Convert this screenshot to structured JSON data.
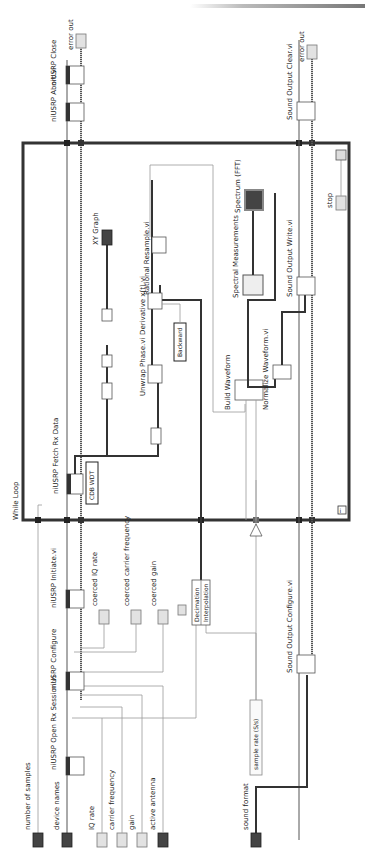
{
  "diagram": {
    "structure": "While Loop",
    "orientation": "rotated 90 degrees counter-clockwise",
    "controls": [
      {
        "label": "number of samples",
        "type": "I32"
      },
      {
        "label": "device names",
        "type": "I/O"
      },
      {
        "label": "IQ rate",
        "type": "DBL"
      },
      {
        "label": "carrier frequency",
        "type": "DBL"
      },
      {
        "label": "gain",
        "type": "DBL"
      },
      {
        "label": "active antenna",
        "type": "abc"
      },
      {
        "label": "sound format",
        "type": "cluster"
      },
      {
        "label": "sample rate (S/s)",
        "type": "constant"
      }
    ],
    "indicators": [
      {
        "label": "coerced IQ rate",
        "type": "DBL"
      },
      {
        "label": "coerced carrier frequency",
        "type": "DBL"
      },
      {
        "label": "coerced gain",
        "type": "DBL"
      },
      {
        "label": "XY Graph",
        "type": "graph"
      },
      {
        "label": "Spectrum (FFT)",
        "type": "graph"
      },
      {
        "label": "error out",
        "type": "cluster"
      },
      {
        "label": "error out",
        "type": "cluster"
      }
    ],
    "subvis": [
      {
        "label": "niUSRP Open Rx Session.vi"
      },
      {
        "label": "niUSRP Configure"
      },
      {
        "label": "niUSRP Initiate.vi"
      },
      {
        "label": "niUSRP Fetch Rx Data"
      },
      {
        "label": "niUSRP Abort.vi"
      },
      {
        "label": "niUSRP Close"
      },
      {
        "label": "Unwrap Phase.vi"
      },
      {
        "label": "Derivative x(t).vi"
      },
      {
        "label": "Rational Resample.vi"
      },
      {
        "label": "Build Waveform"
      },
      {
        "label": "Normalize Waveform.vi"
      },
      {
        "label": "Spectral Measurements"
      },
      {
        "label": "Sound Output Configure.vi"
      },
      {
        "label": "Sound Output Write.vi"
      },
      {
        "label": "Sound Output Clear.vi"
      }
    ],
    "constants": {
      "fetch_type": "CDB WDT",
      "derivative_method": "Backward",
      "resample_ratio_top": "Decimation",
      "resample_ratio_bottom": "Interpolation"
    },
    "stop_label": "stop",
    "loop_label": "While Loop"
  }
}
